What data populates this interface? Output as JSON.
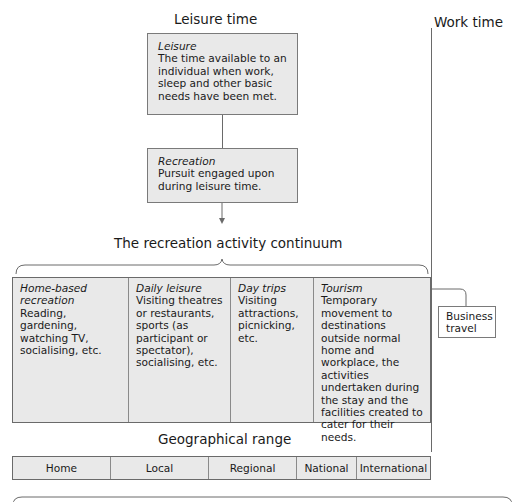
{
  "headings": {
    "leisure_time": "Leisure time",
    "work_time": "Work time",
    "continuum_title": "The recreation activity continuum",
    "geo_title": "Geographical range"
  },
  "leisure_box": {
    "term": "Leisure",
    "definition": "The time available to an individual when work, sleep and other basic needs have been met."
  },
  "recreation_box": {
    "term": "Recreation",
    "definition": "Pursuit engaged upon during leisure time."
  },
  "continuum": [
    {
      "term": "Home-based recreation",
      "description": "Reading, gardening, watching TV, socialising, etc."
    },
    {
      "term": "Daily leisure",
      "description": "Visiting theatres or restaurants, sports (as participant or spectator), socialising, etc."
    },
    {
      "term": "Day trips",
      "description": "Visiting attractions, picnicking, etc."
    },
    {
      "term": "Tourism",
      "description": "Temporary movement to destinations outside normal home and workplace, the activities undertaken during the stay and the facilities created to cater for their needs."
    }
  ],
  "business_travel": {
    "label": "Business travel"
  },
  "geographical_range": [
    "Home",
    "Local",
    "Regional",
    "National",
    "International"
  ],
  "colors": {
    "box_fill": "#e9e9e9",
    "border": "#7a7a7a",
    "line": "#6a6a6a"
  }
}
